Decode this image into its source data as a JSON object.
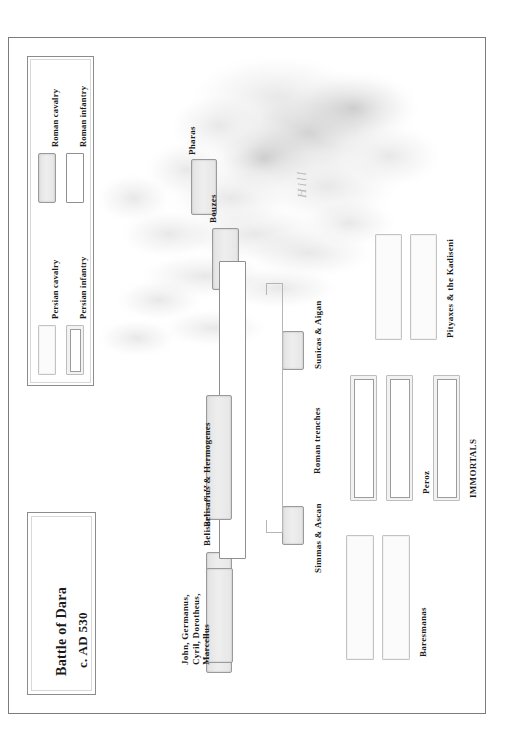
{
  "figure": {
    "title_line1": "Battle of Dara",
    "title_line2": "c. AD 530",
    "terrain_label": "Hill"
  },
  "legend": {
    "items": [
      {
        "label": "Persian cavalry",
        "swatch": "persian-cavalry"
      },
      {
        "label": "Persian infantry",
        "swatch": "persian-infantry"
      },
      {
        "label": "Roman cavalry",
        "swatch": "roman-cavalry"
      },
      {
        "label": "Roman infantry",
        "swatch": "roman-infantry"
      }
    ]
  },
  "roman_units": [
    {
      "id": "pharas",
      "label": "Pharas",
      "type": "roman-cavalry"
    },
    {
      "id": "bouzes",
      "label": "Bouzes",
      "type": "roman-cavalry"
    },
    {
      "id": "belisarius",
      "label": "Belisarius & Hermogenes",
      "type": "roman-cavalry"
    },
    {
      "id": "john",
      "label": "John, Germanus,\nCyril, Dorotheus,\nMarcellus",
      "type": "roman-cavalry"
    },
    {
      "id": "sunicas",
      "label": "Sunicas & Aigan",
      "type": "roman-cavalry"
    },
    {
      "id": "simmas",
      "label": "Simmas & Ascan",
      "type": "roman-cavalry"
    },
    {
      "id": "main-line",
      "label": "",
      "type": "roman-infantry"
    }
  ],
  "persian_units": [
    {
      "id": "pityaxes",
      "label": "Pityaxes & the Kadiseni",
      "type": "persian-cavalry"
    },
    {
      "id": "peroz",
      "label": "Peroz",
      "type": "persian-infantry"
    },
    {
      "id": "immortals",
      "label": "IMMORTALS",
      "type": "persian-infantry"
    },
    {
      "id": "baresmanas",
      "label": "Baresmanas",
      "type": "persian-cavalry"
    }
  ],
  "features": {
    "trenches_label": "Roman trenches"
  },
  "colors": {
    "frame": "#7c7c7c",
    "roman_cavalry_fill": "#e8e8e8",
    "roman_infantry_fill": "#ffffff",
    "persian_fill": "#fbfbfb",
    "hill_shade": "#cfcfcf",
    "text": "#1a1a1a",
    "hill_text": "#b9b9b9"
  }
}
